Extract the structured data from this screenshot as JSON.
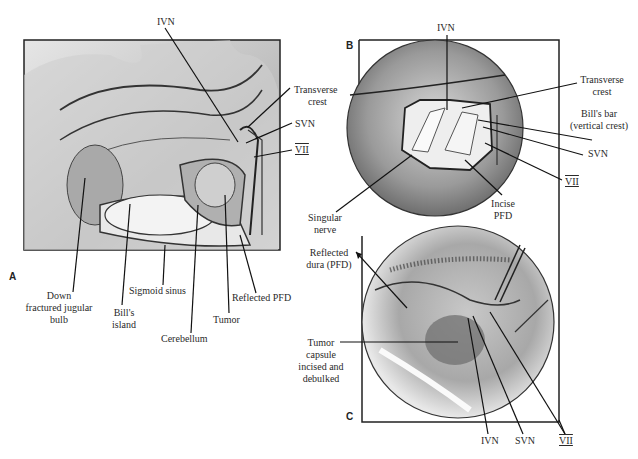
{
  "figure": {
    "panels": [
      {
        "letter": "A",
        "labels": {
          "ivn": "IVN",
          "transverse_crest_1": "Transverse",
          "transverse_crest_2": "crest",
          "svn": "SVN",
          "vii": "VII",
          "down_jugular_1": "Down",
          "down_jugular_2": "fractured jugular",
          "down_jugular_3": "bulb",
          "bills_island_1": "Bill's",
          "bills_island_2": "island",
          "sigmoid_sinus": "Sigmoid sinus",
          "cerebellum": "Cerebellum",
          "tumor": "Tumor",
          "reflected_pfd": "Reflected PFD"
        }
      },
      {
        "letter": "B",
        "labels": {
          "ivn": "IVN",
          "transverse_crest_1": "Transverse",
          "transverse_crest_2": "crest",
          "bills_bar_1": "Bill's bar",
          "bills_bar_2": "(vertical crest)",
          "svn": "SVN",
          "vii": "VII",
          "incise_pfd_1": "Incise",
          "incise_pfd_2": "PFD",
          "singular_nerve_1": "Singular",
          "singular_nerve_2": "nerve"
        }
      },
      {
        "letter": "C",
        "labels": {
          "reflected_dura_1": "Reflected",
          "reflected_dura_2": "dura  (PFD)",
          "tumor_capsule_1": "Tumor",
          "tumor_capsule_2": "capsule",
          "tumor_capsule_3": "incised and",
          "tumor_capsule_4": "debulked",
          "ivn": "IVN",
          "svn": "SVN",
          "vii": "VII"
        }
      }
    ]
  }
}
